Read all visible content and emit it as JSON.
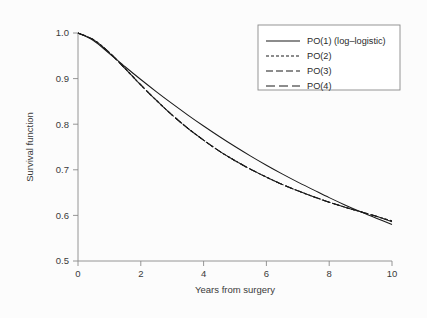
{
  "chart_data": {
    "type": "line",
    "title": "",
    "xlabel": "Years from surgery",
    "ylabel": "Survival function",
    "xlim": [
      0,
      10
    ],
    "ylim": [
      0.5,
      1.0
    ],
    "xticks": [
      0,
      2,
      4,
      6,
      8,
      10
    ],
    "xticklabels": [
      "0",
      "2",
      "4",
      "6",
      "8",
      "10"
    ],
    "yticks": [
      0.5,
      0.6,
      0.7,
      0.8,
      0.9,
      1.0
    ],
    "yticklabels": [
      "0.5",
      "0.6",
      "0.7",
      "0.8",
      "0.9",
      "1.0"
    ],
    "grid": false,
    "legend_position": "upper right",
    "x": [
      0,
      0.5,
      1,
      1.5,
      2,
      2.5,
      3,
      3.5,
      4,
      4.5,
      5,
      5.5,
      6,
      6.5,
      7,
      7.5,
      8,
      8.5,
      9,
      9.5,
      10
    ],
    "series": [
      {
        "name": "PO(1) (log-logistic)",
        "label": "PO(1) (log–logistic)",
        "linestyle": "solid",
        "dasharray": "none",
        "color": "#1a1a1a",
        "values": [
          1.0,
          0.983,
          0.955,
          0.926,
          0.898,
          0.871,
          0.845,
          0.82,
          0.796,
          0.773,
          0.751,
          0.73,
          0.71,
          0.691,
          0.673,
          0.656,
          0.639,
          0.623,
          0.608,
          0.594,
          0.58
        ]
      },
      {
        "name": "PO(2)",
        "label": "PO(2)",
        "linestyle": "dotted-dash",
        "dasharray": "3,2",
        "color": "#1a1a1a",
        "values": [
          1.0,
          0.985,
          0.957,
          0.922,
          0.886,
          0.852,
          0.82,
          0.791,
          0.765,
          0.741,
          0.72,
          0.701,
          0.684,
          0.668,
          0.654,
          0.641,
          0.629,
          0.618,
          0.608,
          0.598,
          0.588
        ]
      },
      {
        "name": "PO(3)",
        "label": "PO(3)",
        "linestyle": "dashed",
        "dasharray": "7,3",
        "color": "#1a1a1a",
        "values": [
          1.0,
          0.985,
          0.957,
          0.922,
          0.886,
          0.852,
          0.82,
          0.791,
          0.765,
          0.741,
          0.72,
          0.701,
          0.684,
          0.668,
          0.654,
          0.641,
          0.629,
          0.618,
          0.608,
          0.598,
          0.587
        ]
      },
      {
        "name": "PO(4)",
        "label": "PO(4)",
        "linestyle": "long-dashed",
        "dasharray": "9,4",
        "color": "#1a1a1a",
        "values": [
          1.0,
          0.985,
          0.957,
          0.922,
          0.886,
          0.852,
          0.82,
          0.791,
          0.765,
          0.741,
          0.72,
          0.701,
          0.684,
          0.668,
          0.654,
          0.641,
          0.629,
          0.618,
          0.608,
          0.598,
          0.586
        ]
      }
    ],
    "annotations": [
      "All four survival curves start at 1.0 at year 0.",
      "PO(2), PO(3) and PO(4) are nearly indistinguishable and overlap across the whole range.",
      "PO(1) lies above the other curves between roughly year 1 and year 7, then crosses below them."
    ]
  },
  "legend": {
    "entries": [
      {
        "label": "PO(1) (log–logistic)",
        "dasharray": "none"
      },
      {
        "label": "PO(2)",
        "dasharray": "3,2"
      },
      {
        "label": "PO(3)",
        "dasharray": "7,3"
      },
      {
        "label": "PO(4)",
        "dasharray": "9,4"
      }
    ]
  },
  "colors": {
    "background": "#fcfcfc",
    "axis": "#8a8a8a",
    "line": "#1a1a1a",
    "text": "#3a3a3a"
  }
}
